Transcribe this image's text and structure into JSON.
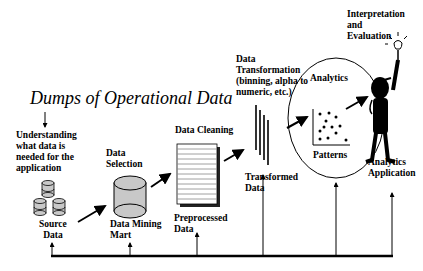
{
  "title": "Dumps of Operational Data",
  "labels": {
    "understanding": "Understanding\nwhat data is\nneeded for the\napplication",
    "data_selection": "Data\nSelection",
    "source_data": "Source\nData",
    "data_mining_mart": "Data Mining\nMart",
    "data_cleaning": "Data Cleaning",
    "preprocessed_data": "Preprocessed\nData",
    "data_transformation": "Data\nTransformation\n(binning, alpha to\nnumeric, etc.)",
    "transformed_data": "Transformed\nData",
    "analytics": "Analytics",
    "patterns": "Patterns",
    "interpretation": "Interpretation\nand\nEvaluation",
    "analytics_application": "Analytics\nApplication"
  },
  "colors": {
    "ink": "#000000",
    "db_fill": "#c8c8c8",
    "background": "#ffffff"
  }
}
